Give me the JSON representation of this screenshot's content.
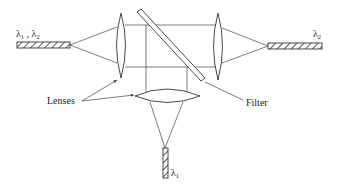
{
  "diagram": {
    "type": "optical wavelength demultiplexer",
    "labels": {
      "input_fiber": {
        "symbol": "λ",
        "sub1": "1",
        "sep": " , ",
        "symbol2": "λ",
        "sub2": "2"
      },
      "output_fiber_right": {
        "symbol": "λ",
        "sub": "2"
      },
      "output_fiber_bottom": {
        "symbol": "λ",
        "sub": "1"
      },
      "lenses": "Lenses",
      "filter": "Filter"
    },
    "components": [
      {
        "id": "input-fiber",
        "carries": [
          "λ1",
          "λ2"
        ]
      },
      {
        "id": "left-lens",
        "role": "collimating lens"
      },
      {
        "id": "filter",
        "role": "dichroic filter (diagonal)"
      },
      {
        "id": "right-lens",
        "role": "focusing lens"
      },
      {
        "id": "right-fiber",
        "carries": [
          "λ2"
        ]
      },
      {
        "id": "bottom-lens",
        "role": "focusing lens"
      },
      {
        "id": "bottom-fiber",
        "carries": [
          "λ1"
        ]
      }
    ],
    "colors": {
      "line": "#333333",
      "background": "#ffffff"
    }
  }
}
